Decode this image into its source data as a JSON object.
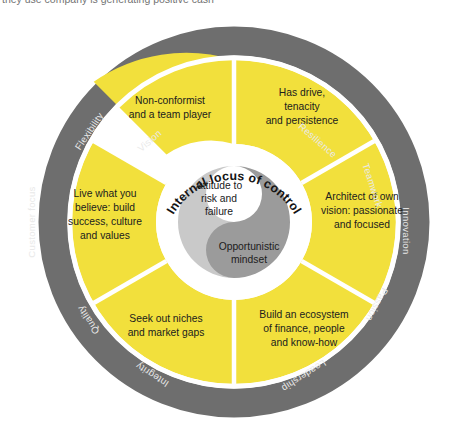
{
  "page": {
    "caption_above": "they use company is generating positive cash"
  },
  "diagram": {
    "colors": {
      "outer_ring": "#6e6e6e",
      "segment_yellow": "#f2e03c",
      "inner_white": "#ffffff",
      "yin_light": "#c9c9c9",
      "yin_dark": "#9b9b9b",
      "segment_text": "#20201c",
      "ring_label_text": "#e9e9e9",
      "background": "#ffffff"
    },
    "center": {
      "arc_title": "Internal locus of control",
      "light_half_label": [
        "Attitude to",
        "risk and",
        "failure"
      ],
      "dark_half_label": [
        "Opportunistic",
        "mindset"
      ]
    },
    "segments": [
      {
        "id": "non-conformist",
        "lines": [
          "Non-conformist",
          "and a team player"
        ],
        "start_angle": -90,
        "end_angle": -30
      },
      {
        "id": "has-drive",
        "lines": [
          "Has drive,",
          "tenacity",
          "and persistence"
        ],
        "start_angle": -90,
        "end_angle": -150
      },
      {
        "id": "architect-of-own-vision",
        "lines": [
          "Architect of own",
          "vision: passionate",
          "and focused"
        ],
        "start_angle": -30,
        "end_angle": 30
      },
      {
        "id": "build-ecosystem",
        "lines": [
          "Build an ecosystem",
          "of finance, people",
          "and know-how"
        ],
        "start_angle": 30,
        "end_angle": 90
      },
      {
        "id": "seek-out-niches",
        "lines": [
          "Seek out niches",
          "and market gaps"
        ],
        "start_angle": 90,
        "end_angle": 150
      },
      {
        "id": "live-what-you-believe",
        "lines": [
          "Live what you",
          "believe: build",
          "success, culture",
          "and values"
        ],
        "start_angle": 150,
        "end_angle": 210
      }
    ],
    "ring_labels": [
      {
        "id": "vision",
        "text": "Vision",
        "angle": -63
      },
      {
        "id": "resilience",
        "text": "Resilience",
        "angle": -27
      },
      {
        "id": "teamwork",
        "text": "Teamwork",
        "angle": -55
      },
      {
        "id": "innovation",
        "text": "Innovation",
        "angle": 0
      },
      {
        "id": "passion",
        "text": "Passion",
        "angle": 52
      },
      {
        "id": "leadership",
        "text": "Leadership",
        "angle": 70
      },
      {
        "id": "integrity",
        "text": "Integrity",
        "angle": 110
      },
      {
        "id": "quality",
        "text": "Quality",
        "angle": 128
      },
      {
        "id": "customer-focus",
        "text": "Customer focus",
        "angle": 180
      },
      {
        "id": "flexibility",
        "text": "Flexibility",
        "angle": 215
      }
    ]
  }
}
